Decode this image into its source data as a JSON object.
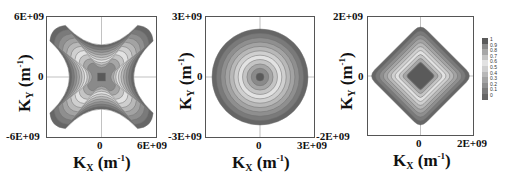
{
  "chart_data": [
    {
      "type": "heatmap",
      "subtype": "filled-contour",
      "title": "",
      "shape": "four-armed star (X-shaped) along diagonals",
      "xlabel": "K_X (m^-1)",
      "ylabel": "K_Y (m^-1)",
      "xlim": [
        -6000000000.0,
        6000000000.0
      ],
      "ylim": [
        -6000000000.0,
        6000000000.0
      ],
      "x_ticks": [
        "0",
        "6E+09"
      ],
      "y_ticks": [
        "6E+09",
        "0",
        "-6E+09"
      ],
      "center_value": 1,
      "edge_value": 0
    },
    {
      "type": "heatmap",
      "subtype": "filled-contour",
      "title": "",
      "shape": "circular concentric contours",
      "xlabel": "K_X (m^-1)",
      "ylabel": "K_Y (m^-1)",
      "xlim": [
        -3000000000.0,
        3000000000.0
      ],
      "ylim": [
        -3000000000.0,
        3000000000.0
      ],
      "x_ticks": [
        "0",
        "3E+09"
      ],
      "y_ticks": [
        "3E+09",
        "0",
        "-3E+09"
      ],
      "center_value": 1,
      "edge_value": 0
    },
    {
      "type": "heatmap",
      "subtype": "filled-contour",
      "title": "",
      "shape": "diamond (rotated square) concentric contours",
      "xlabel": "K_X (m^-1)",
      "ylabel": "K_Y (m^-1)",
      "xlim": [
        -2000000000.0,
        2000000000.0
      ],
      "ylim": [
        -2000000000.0,
        2000000000.0
      ],
      "x_ticks": [
        "0",
        "2E+09"
      ],
      "y_ticks": [
        "2E+09",
        "0",
        "-2E+09"
      ],
      "center_value": 1,
      "edge_value": 0,
      "legend": {
        "levels": [
          1,
          0.9,
          0.8,
          0.7,
          0.6,
          0.5,
          0.4,
          0.3,
          0.2,
          0.1,
          0
        ],
        "position": "right"
      }
    }
  ],
  "panels": [
    {
      "ytick_top": "6E+09",
      "ytick_mid": "0",
      "ytick_bot": "-6E+09",
      "xtick_mid": "0",
      "xtick_right": "6E+09",
      "xlabel_main": "K",
      "xlabel_sub": "X",
      "unit_open": " (m",
      "unit_sup": "-1",
      "unit_close": ")",
      "ylabel_main": "K",
      "ylabel_sub": "Y"
    },
    {
      "ytick_top": "3E+09",
      "ytick_mid": "0",
      "ytick_bot": "-3E+09",
      "xtick_mid": "0",
      "xtick_right": "3E+09",
      "xlabel_main": "K",
      "xlabel_sub": "X",
      "unit_open": " (m",
      "unit_sup": "-1",
      "unit_close": ")",
      "ylabel_main": "K",
      "ylabel_sub": "Y"
    },
    {
      "ytick_top": "2E+09",
      "ytick_mid": "0",
      "ytick_bot": "-2E+09",
      "xtick_mid": "0",
      "xtick_right": "2E+09",
      "xlabel_main": "K",
      "xlabel_sub": "X",
      "unit_open": " (m",
      "unit_sup": "-1",
      "unit_close": ")",
      "ylabel_main": "K",
      "ylabel_sub": "Y"
    }
  ],
  "legend": {
    "labels": [
      "1",
      "0.9",
      "0.8",
      "0.7",
      "0.6",
      "0.5",
      "0.4",
      "0.3",
      "0.2",
      "0.1",
      "0"
    ],
    "colors": [
      "#5a5a5a",
      "#8a8a8a",
      "#a6a6a6",
      "#c4c4c4",
      "#e2e2e2",
      "#cfcfcf",
      "#b8b8b8",
      "#a3a3a3",
      "#8f8f8f",
      "#7a7a7a",
      "#666666"
    ]
  },
  "colors": {
    "frame": "#555555",
    "axis_line": "#888888",
    "contour_line": "#6f6f6f"
  }
}
